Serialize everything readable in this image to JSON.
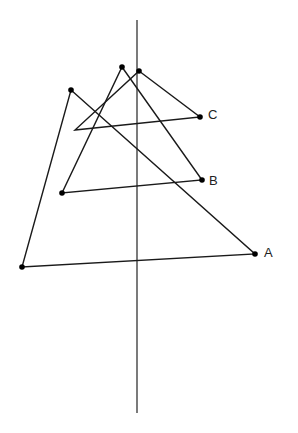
{
  "diagram": {
    "axis": {
      "x": 137,
      "y1": 20,
      "y2": 413
    },
    "stroke_color": "#1a1a1a",
    "triangles": [
      {
        "name": "A",
        "label": "A",
        "points": [
          [
            71,
            90
          ],
          [
            255,
            254
          ],
          [
            22,
            267
          ]
        ],
        "label_pos": [
          264,
          246
        ]
      },
      {
        "name": "B",
        "label": "B",
        "points": [
          [
            122,
            67
          ],
          [
            202,
            180
          ],
          [
            62,
            193
          ]
        ],
        "label_pos": [
          209,
          174
        ]
      },
      {
        "name": "C",
        "label": "C",
        "points": [
          [
            139,
            71
          ],
          [
            200,
            117
          ],
          [
            75,
            130
          ]
        ],
        "label_pos": [
          208,
          108
        ]
      }
    ],
    "dots": [
      [
        71,
        90
      ],
      [
        255,
        254
      ],
      [
        22,
        267
      ],
      [
        122,
        67
      ],
      [
        202,
        180
      ],
      [
        62,
        193
      ],
      [
        139,
        71
      ],
      [
        200,
        117
      ]
    ]
  }
}
